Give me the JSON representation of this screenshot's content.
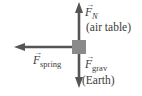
{
  "diagram": {
    "type": "free-body diagram",
    "object": {
      "shape": "square",
      "color": "#8a8a8a"
    },
    "arrow_color": "#555555",
    "forces": [
      {
        "symbol": "F",
        "subscript": "N",
        "source": "(air table)",
        "direction": "up"
      },
      {
        "symbol": "F",
        "subscript": "spring",
        "source": "",
        "direction": "left"
      },
      {
        "symbol": "F",
        "subscript": "grav",
        "source": "(Earth)",
        "direction": "down"
      }
    ],
    "vector_mark": "→"
  }
}
